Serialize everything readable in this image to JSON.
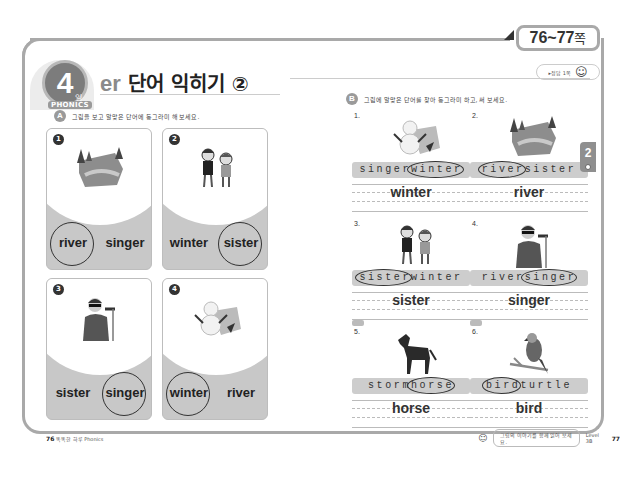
{
  "page_range": {
    "numbers": "76~77",
    "suffix": "쪽"
  },
  "header": {
    "day_number": "4",
    "day_unit": "일",
    "category": "PHONICS",
    "title_prefix": "er",
    "title_main": "단어 익히기 ②",
    "answer_pill": "▸정답 1쪽"
  },
  "section_a": {
    "marker": "A",
    "instruction": "그림을 보고 알맞은 단어에 동그라미 해 보세요.",
    "cards": [
      {
        "num": "1",
        "picture": "river-landscape",
        "words": [
          "river",
          "singer"
        ],
        "circled": 0
      },
      {
        "num": "2",
        "picture": "two-girls",
        "words": [
          "winter",
          "sister"
        ],
        "circled": 1
      },
      {
        "num": "3",
        "picture": "singer-with-mic",
        "words": [
          "sister",
          "singer"
        ],
        "circled": 1
      },
      {
        "num": "4",
        "picture": "snowman-winter",
        "words": [
          "winter",
          "river"
        ],
        "circled": 0
      }
    ]
  },
  "section_b": {
    "marker": "B",
    "instruction": "그림에 알맞은 단어를 찾아 동그라미 하고, 써 보세요.",
    "exercises": [
      {
        "num": "1.",
        "picture": "snowman-winter",
        "parts": [
          "singer",
          "winter"
        ],
        "circled": 1,
        "answer": "winter",
        "tag": false
      },
      {
        "num": "2.",
        "picture": "river-landscape",
        "parts": [
          "river",
          "sister"
        ],
        "circled": 0,
        "answer": "river",
        "tag": false
      },
      {
        "num": "3.",
        "picture": "two-girls",
        "parts": [
          "sister",
          "winter"
        ],
        "circled": 0,
        "answer": "sister",
        "tag": false
      },
      {
        "num": "4.",
        "picture": "singer-with-mic",
        "parts": [
          "river",
          "singer"
        ],
        "circled": 1,
        "answer": "singer",
        "tag": false
      },
      {
        "num": "5.",
        "picture": "horse",
        "parts": [
          "storm",
          "horse"
        ],
        "circled": 1,
        "answer": "horse",
        "tag": true
      },
      {
        "num": "6.",
        "picture": "bird-on-branch",
        "parts": [
          "bird",
          "turtle"
        ],
        "circled": 0,
        "answer": "bird",
        "tag": true
      }
    ]
  },
  "side_tab": {
    "label": "2"
  },
  "footer": {
    "left_page": "76",
    "left_text": "똑똑한 하루 Phonics",
    "right_hint": "그림의 이야기를 함께 읽어 보세요.",
    "right_level": "Level 3B",
    "right_page": "77"
  }
}
